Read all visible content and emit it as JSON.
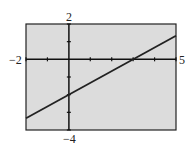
{
  "chart_data": {
    "type": "line",
    "title": "",
    "xlabel": "",
    "ylabel": "",
    "xlim": [
      -2,
      5
    ],
    "ylim": [
      -4,
      2
    ],
    "xscale": 1,
    "yscale": 1,
    "grid": false,
    "series": [
      {
        "name": "y = (2/3)x - 2",
        "x": [
          -2,
          5
        ],
        "y": [
          -3.333,
          1.333
        ]
      }
    ],
    "labels": {
      "xmin": "−2",
      "xmax": "5",
      "ymax": "2",
      "ymin": "−4"
    }
  },
  "colors": {
    "background": "#dcdcdc",
    "line": "#222222",
    "frame": "#222222"
  }
}
